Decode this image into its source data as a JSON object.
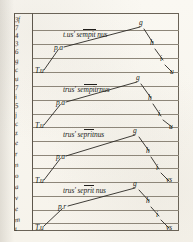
{
  "document": {
    "kind": "manuscript-page",
    "title": "Medieval music-theory diagram page",
    "ink_color": "#211f1c",
    "rule_color": "#8d8679",
    "parchment_color": "#f8f6ef",
    "staff_line_count": 16
  },
  "margin_column": {
    "name": "marginal-annotation-column",
    "marks": [
      "3f",
      "7",
      "4",
      "3",
      "6",
      "g",
      "c",
      "u",
      "7",
      "i",
      "5",
      "j",
      "c",
      "z",
      "e",
      "r",
      "n",
      "o",
      "a",
      "v",
      "e",
      "m",
      "t",
      "b",
      "p"
    ]
  },
  "systems": [
    {
      "index": 1,
      "phrase": "t.us' sempit nus",
      "phrase_parts": {
        "pre": "t.us' se",
        "macron": "mpit",
        "post": " nus"
      },
      "ascending": [
        {
          "label": "T.u",
          "x": 38,
          "y": 72
        },
        {
          "label": "p.a",
          "x": 56,
          "y": 49
        },
        {
          "label": "g",
          "x": 141,
          "y": 24
        }
      ],
      "descending": [
        {
          "label": "h",
          "x": 152,
          "y": 45
        },
        {
          "label": "i",
          "x": 162,
          "y": 61
        },
        {
          "label": "u",
          "x": 171,
          "y": 73
        }
      ]
    },
    {
      "index": 2,
      "phrase": "trinus sempiternus",
      "phrase_parts": {
        "pre": "trus' se",
        "macron": "mpit",
        "post": "rnus"
      },
      "ascending": [
        {
          "label": "T.u",
          "x": 38,
          "y": 127
        },
        {
          "label": "p.a",
          "x": 58,
          "y": 104
        },
        {
          "label": "g",
          "x": 138,
          "y": 79
        }
      ],
      "descending": [
        {
          "label": "h",
          "x": 150,
          "y": 100
        },
        {
          "label": "i",
          "x": 160,
          "y": 117
        },
        {
          "label": "u",
          "x": 171,
          "y": 128
        }
      ]
    },
    {
      "index": 3,
      "phrase": "trinus sempiternus",
      "phrase_parts": {
        "pre": "trus' se",
        "macron": "prit",
        "post": "nus"
      },
      "ascending": [
        {
          "label": "T.u",
          "x": 38,
          "y": 182
        },
        {
          "label": "p.a",
          "x": 58,
          "y": 158
        },
        {
          "label": "g",
          "x": 136,
          "y": 132
        }
      ],
      "descending": [
        {
          "label": "h",
          "x": 148,
          "y": 153
        },
        {
          "label": "i",
          "x": 158,
          "y": 170
        },
        {
          "label": "vs",
          "x": 168,
          "y": 182
        }
      ]
    },
    {
      "index": 4,
      "phrase": "trinus sempiternus",
      "phrase_parts": {
        "pre": "trus' se",
        "macron": "prit",
        "post": " nus"
      },
      "ascending": [
        {
          "label": "T.u",
          "x": 38,
          "y": 228
        },
        {
          "label": "p.r",
          "x": 60,
          "y": 208
        },
        {
          "label": "g",
          "x": 136,
          "y": 185
        }
      ],
      "descending": [
        {
          "label": "h",
          "x": 148,
          "y": 203
        },
        {
          "label": "i",
          "x": 158,
          "y": 217
        },
        {
          "label": "vs",
          "x": 168,
          "y": 229
        }
      ]
    }
  ]
}
